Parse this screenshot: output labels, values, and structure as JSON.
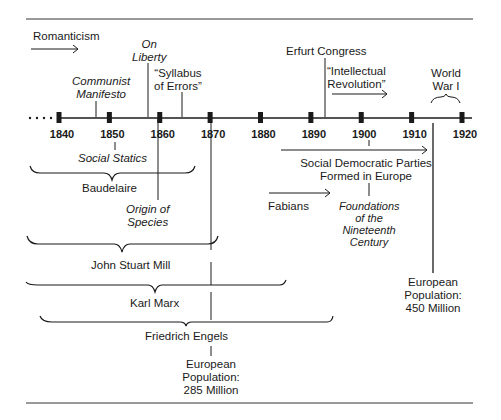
{
  "timeline": {
    "years": [
      "1840",
      "1850",
      "1860",
      "1870",
      "1880",
      "1890",
      "1900",
      "1910",
      "1920"
    ],
    "leading_ellipsis": "· · · ·"
  },
  "events": {
    "romanticism": "Romanticism",
    "communist_manifesto": [
      "Communist",
      "Manifesto"
    ],
    "on_liberty": [
      "On",
      "Liberty"
    ],
    "syllabus_of_errors": [
      "“Syllabus",
      "of Errors”"
    ],
    "erfurt_congress": "Erfurt Congress",
    "intellectual_revolution": [
      "“Intellectual",
      "Revolution”"
    ],
    "world_war_i": [
      "World",
      "War I"
    ],
    "social_statics": "Social Statics",
    "baudelaire": "Baudelaire",
    "origin_of_species": [
      "Origin of",
      "Species"
    ],
    "social_democratic_parties": [
      "Social Democratic Parties",
      "Formed in Europe"
    ],
    "fabians": "Fabians",
    "foundations": [
      "Foundations",
      "of the",
      "Nineteenth",
      "Century"
    ],
    "john_stuart_mill": "John Stuart Mill",
    "karl_marx": "Karl Marx",
    "friedrich_engels": "Friedrich Engels",
    "population_1870": [
      "European",
      "Population:",
      "285 Million"
    ],
    "population_1914": [
      "European",
      "Population:",
      "450 Million"
    ]
  },
  "colors": {
    "ink": "#1a1a1a",
    "background": "#ffffff"
  }
}
